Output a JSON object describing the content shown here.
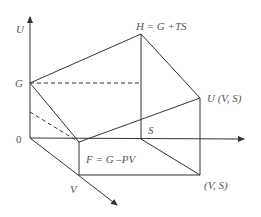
{
  "diagram": {
    "type": "thermodynamic-potentials-3d",
    "axes": {
      "vertical": "U",
      "horizontal": "S",
      "depth": "V",
      "origin": "0"
    },
    "labels": {
      "u_axis": "U",
      "g_point": "G",
      "origin": "0",
      "h_point": "H = G +TS",
      "u_point": "U (V, S)",
      "s_point": "S",
      "f_point": "F = G –PV",
      "v_axis": "V",
      "vs_point": "(V, S)"
    },
    "colors": {
      "line": "#333333",
      "text": "#555555",
      "background": "#ffffff"
    }
  }
}
